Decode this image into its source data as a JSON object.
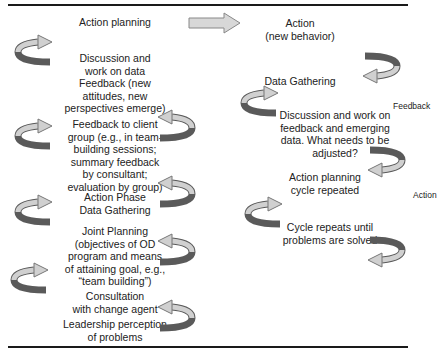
{
  "left_column": [
    {
      "id": "action-planning",
      "text": "Action planning"
    },
    {
      "id": "discussion-data",
      "text": "Discussion and\nwork on data\nFeedback (new\nattitudes, new\nperspectives emerge)"
    },
    {
      "id": "feedback-client",
      "text": "Feedback to client\ngroup (e.g., in team-\nbuilding sessions;\nsummary feedback\nby consultant;\nevaluation by group)"
    },
    {
      "id": "action-phase",
      "text": "Action Phase\nData Gathering"
    },
    {
      "id": "joint-planning",
      "text": "Joint Planning\n(objectives of OD\nprogram and means\nof attaining goal, e.g.,\n“team building”)"
    },
    {
      "id": "consultation",
      "text": "Consultation\nwith change agent"
    },
    {
      "id": "leadership",
      "text": "Leadership perception\nof problems"
    }
  ],
  "right_column": [
    {
      "id": "action-new-behavior",
      "text": "Action\n(new behavior)"
    },
    {
      "id": "data-gathering",
      "text": "Data Gathering"
    },
    {
      "id": "discussion-feedback",
      "text": "Discussion and work on\nfeedback and emerging\ndata. What needs to be\nadjusted?"
    },
    {
      "id": "action-planning-repeated",
      "text": "Action planning\ncycle repeated"
    },
    {
      "id": "cycle-repeats",
      "text": "Cycle repeats until\nproblems are solved"
    }
  ],
  "side_labels": {
    "feedback": "Feedback",
    "action": "Action"
  },
  "colors": {
    "arrow_dark": "#5a5a5a",
    "arrow_light": "#d0d0d0",
    "rule": "#1a1a1a"
  }
}
